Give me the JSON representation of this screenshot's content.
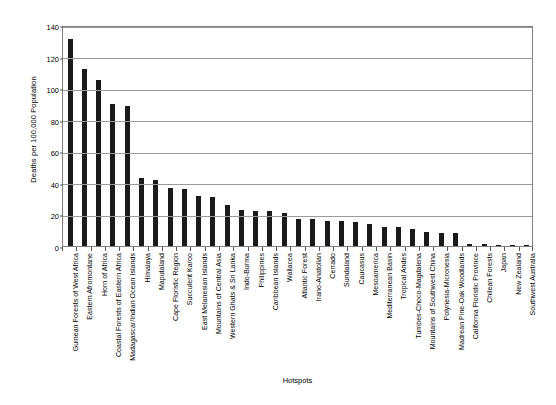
{
  "chart_data": {
    "type": "bar",
    "title": "",
    "xlabel": "Hotspots",
    "ylabel": "Deaths per 100,000 Population",
    "ylim": [
      0,
      140
    ],
    "ytick_step": 20,
    "yticks": [
      0,
      20,
      40,
      60,
      80,
      100,
      120,
      140
    ],
    "grid": true,
    "legend": "none",
    "bar_color": "#1a1a1a",
    "categories": [
      "Guinean Forests of West Africa",
      "Eastern Afromontane",
      "Horn of Africa",
      "Coastal Forests of Eastern Africa",
      "Madagascar/Indian Ocean Islands",
      "Himalaya",
      "Maputaland",
      "Cape Floristic Region",
      "Succulent Karoo",
      "East Melanesian Islands",
      "Mountains of Central Asia",
      "Western Ghats & Sri Lanka",
      "Indo-Burma",
      "Philippines",
      "Caribbean Islands",
      "Wallacea",
      "Atlantic Forest",
      "Irano-Anatolian",
      "Cerrado",
      "Sundaland",
      "Caucasus",
      "Mesoamerica",
      "Mediterranean Basin",
      "Tropical Andes",
      "Tumbes-Choco-Magdalena",
      "Mountains of Southwest China",
      "Polynesia-Micronesia",
      "Madrean Pine-Oak Woodlands",
      "California Floristic Province",
      "Chilean Forests",
      "Japan",
      "New Zealand",
      "Southwest Australia"
    ],
    "values": [
      131,
      112,
      105,
      90,
      89,
      43,
      42,
      37,
      36,
      32,
      31,
      26,
      23,
      22,
      22,
      21,
      17,
      17,
      16,
      16,
      15,
      14,
      12,
      12,
      11,
      9,
      8,
      8,
      1.5,
      1,
      0.8,
      0.6,
      0.5
    ]
  },
  "axis": {
    "y_title": "Deaths per 100,000 Population",
    "x_title": "Hotspots"
  }
}
